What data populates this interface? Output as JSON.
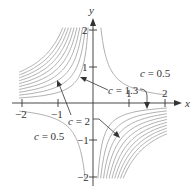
{
  "chart_data": {
    "type": "contour",
    "title": "",
    "xlabel": "x",
    "ylabel": "y",
    "xlim": [
      -2,
      2
    ],
    "ylim": [
      -2,
      2
    ],
    "x_ticks": [
      -2,
      -1,
      1,
      2
    ],
    "y_ticks": [
      -2,
      -1,
      1,
      2
    ],
    "x_tick_labels": [
      "−2",
      "−1",
      "1",
      "2"
    ],
    "y_tick_labels": [
      "−2",
      "−1",
      "1",
      "2"
    ],
    "grid": false,
    "legend": null,
    "series": [
      {
        "name": "c = 0.5 (quadrant I)",
        "quadrant": 1,
        "levels": [
          0.5
        ]
      },
      {
        "name": "c = 0.5 (quadrant III)",
        "quadrant": 3,
        "levels": [
          0.5
        ]
      },
      {
        "name": "nested level curves (quadrant II)",
        "quadrant": 2,
        "levels": [
          1.3,
          2,
          2.7,
          3.4,
          4.1,
          4.8,
          5.5,
          6.2,
          6.9,
          7.6
        ]
      },
      {
        "name": "nested level curves (quadrant IV)",
        "quadrant": 4,
        "levels": [
          1.3,
          2,
          2.7,
          3.4,
          4.1,
          4.8,
          5.5,
          6.2,
          6.9,
          7.6
        ]
      }
    ],
    "annotations": [
      {
        "text": "c = 0.5",
        "position": "quadrant I, right"
      },
      {
        "text": "c = 1.3",
        "position": "near origin, arrows to quadrant II and IV innermost curves"
      },
      {
        "text": "c = 2",
        "position": "below x-axis left of y-axis, arrows to quadrant II and IV second curves"
      },
      {
        "text": "c = 0.5",
        "position": "quadrant III, left"
      }
    ]
  },
  "axes": {
    "x_label": "x",
    "y_label": "y",
    "x_ticks": [
      "−2",
      "−1",
      "1",
      "2"
    ],
    "y_ticks": [
      "2",
      "1",
      "−1",
      "−2"
    ]
  },
  "labels": {
    "c05_q1": "c = 0.5",
    "c13": "c = 1.3",
    "c2": "c = 2",
    "c05_q3": "c = 0.5"
  }
}
